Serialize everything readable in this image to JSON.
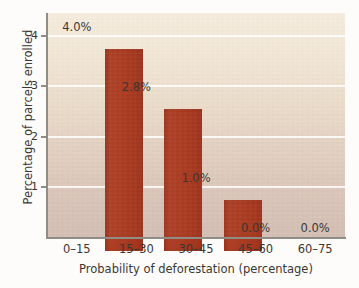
{
  "chart_data": {
    "type": "bar",
    "title": "",
    "subtitle": "",
    "xlabel": "Probability of deforestation (percentage)",
    "ylabel": "Percentage of parcels enrolled",
    "categories": [
      "0–15",
      "15–30",
      "30–45",
      "45–60",
      "60–75"
    ],
    "values": [
      4.0,
      2.8,
      1.0,
      0.0,
      0.0
    ],
    "data_labels": [
      "4.0%",
      "2.8%",
      "1.0%",
      "0.0%",
      "0.0%"
    ],
    "ylim": [
      0,
      4.45
    ],
    "yticks": [
      1,
      2,
      3,
      4
    ],
    "ytick_labels": [
      "1",
      "2",
      "3",
      "4"
    ],
    "grid": "horizontal",
    "legend": "none",
    "bar_color": "#a93a20",
    "gridline_color": "#ffffff",
    "axis_color": "#8e8d86",
    "text_color": "#3b3733",
    "plot_bg_top": "#f5ecdd",
    "plot_bg_bottom": "#d4beb3"
  }
}
